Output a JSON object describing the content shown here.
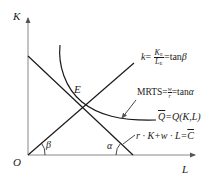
{
  "diagram": {
    "type": "producer-equilibrium",
    "axes": {
      "y_label": "K",
      "x_label": "L",
      "origin_label": "O"
    },
    "points": {
      "equilibrium_label": "E"
    },
    "angles": {
      "ray_angle": "β",
      "budget_angle": "α"
    },
    "annotations": {
      "expansion_ray": {
        "lhs": "k",
        "eq": "=",
        "num": "K",
        "num_sub": "E",
        "den": "L",
        "den_sub": "E",
        "rhs": "=tan",
        "rhs_greek": "β"
      },
      "mrts": {
        "lhs": "MRTS",
        "eq": "=",
        "num": "w",
        "den": "r",
        "rhs": "=tan",
        "rhs_greek": "α"
      },
      "isoquant": {
        "lhs": "Q",
        "rhs": "=Q(K,L)"
      },
      "isocost": {
        "text": "r · K+w · L=",
        "rhs": "C"
      }
    },
    "colors": {
      "line": "#1a1a1a",
      "axis": "#777777"
    }
  }
}
